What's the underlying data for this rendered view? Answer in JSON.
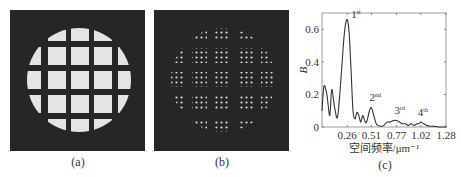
{
  "figure": {
    "panels": [
      {
        "id": "a",
        "caption": "(a)",
        "description": "Grid mask image (5x5 bright squares within circular aperture on dark background)"
      },
      {
        "id": "b",
        "caption": "(b)",
        "description": "Dotted pattern image (squares filled with bright dot arrays within circular aperture)"
      },
      {
        "id": "c",
        "caption": "(c)",
        "description": "Spatial frequency spectrum"
      }
    ],
    "colors": {
      "panel_bg": "#262626",
      "bright": "#e6e6e6",
      "curve": "#333333",
      "axis": "#555555"
    }
  },
  "chart_data": {
    "type": "line",
    "title": "",
    "xlabel": "空间频率/μm⁻¹",
    "ylabel": "B",
    "xlim": [
      0,
      1.28
    ],
    "ylim": [
      0,
      0.7
    ],
    "x_ticks": [
      "0.26",
      "0.51",
      "0.77",
      "1.02",
      "1.28"
    ],
    "y_ticks": [
      "0",
      "0.2",
      "0.4",
      "0.6"
    ],
    "grid": false,
    "legend": null,
    "annotations": [
      {
        "text": "1st",
        "base": "1",
        "sup": "st",
        "x": 0.26,
        "y": 0.66
      },
      {
        "text": "2nd",
        "base": "2",
        "sup": "nd",
        "x": 0.51,
        "y": 0.12
      },
      {
        "text": "3rd",
        "base": "3",
        "sup": "rd",
        "x": 0.77,
        "y": 0.04
      },
      {
        "text": "4th",
        "base": "4",
        "sup": "th",
        "x": 1.02,
        "y": 0.03
      }
    ],
    "series": [
      {
        "name": "B",
        "x": [
          0.0,
          0.02,
          0.05,
          0.08,
          0.1,
          0.13,
          0.16,
          0.19,
          0.22,
          0.24,
          0.26,
          0.28,
          0.3,
          0.32,
          0.34,
          0.36,
          0.38,
          0.4,
          0.42,
          0.44,
          0.46,
          0.49,
          0.51,
          0.53,
          0.56,
          0.58,
          0.61,
          0.64,
          0.67,
          0.7,
          0.74,
          0.77,
          0.8,
          0.83,
          0.86,
          0.89,
          0.92,
          0.95,
          0.98,
          1.0,
          1.02,
          1.05,
          1.08,
          1.12,
          1.16,
          1.2,
          1.24,
          1.28
        ],
        "y": [
          0.1,
          0.25,
          0.2,
          0.07,
          0.23,
          0.12,
          0.06,
          0.25,
          0.5,
          0.62,
          0.66,
          0.58,
          0.35,
          0.1,
          0.05,
          0.09,
          0.07,
          0.03,
          0.07,
          0.04,
          0.03,
          0.1,
          0.12,
          0.08,
          0.02,
          0.01,
          0.005,
          0.01,
          0.03,
          0.03,
          0.04,
          0.04,
          0.03,
          0.02,
          0.02,
          0.01,
          0.02,
          0.01,
          0.02,
          0.02,
          0.03,
          0.02,
          0.01,
          0.005,
          0.005,
          0.0,
          0.0,
          0.0
        ]
      }
    ]
  }
}
